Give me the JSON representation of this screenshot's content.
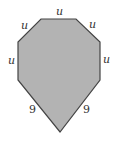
{
  "diagram": {
    "shape": "heptagon",
    "fill_color": "#b3b3b3",
    "stroke_color": "#444444",
    "vertices": [
      [
        41,
        19
      ],
      [
        76,
        19
      ],
      [
        100,
        42
      ],
      [
        100,
        80
      ],
      [
        60,
        132
      ],
      [
        18,
        80
      ],
      [
        18,
        42
      ]
    ],
    "labels": {
      "top": "u",
      "top_right": "u",
      "right": "u",
      "bottom_right": "9",
      "bottom_left": "9",
      "left": "u",
      "top_left": "u"
    }
  }
}
